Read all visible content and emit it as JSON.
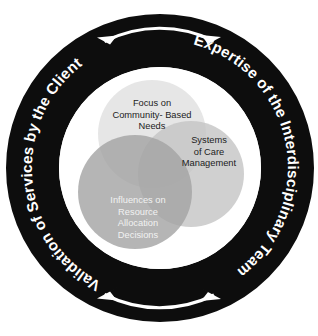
{
  "diagram": {
    "outer_ring": {
      "fill_color": "#0d0d0d",
      "text_color": "#ffffff",
      "labels": [
        {
          "id": "top-right",
          "text": "Expertise of the Interdisciplinary Team"
        },
        {
          "id": "bottom-left",
          "text": "Validation of Services by the Client"
        }
      ],
      "arrows": [
        {
          "id": "top-arc-arrow",
          "name": "double-headed-arc-arrow-top",
          "direction": "bidirectional",
          "position": "top"
        },
        {
          "id": "bottom-arc-arrow",
          "name": "double-headed-arc-arrow-bottom",
          "direction": "bidirectional",
          "position": "bottom"
        }
      ]
    },
    "venn": {
      "background_color": "#ffffff",
      "overlap_center_color": "#757575",
      "circles": [
        {
          "id": "focus-community",
          "label": "Focus on Community- Based Needs",
          "lines": [
            "Focus on",
            "Community- Based",
            "Needs"
          ],
          "fill_color": "#e4e4e4",
          "text_color": "#1c1c1c"
        },
        {
          "id": "systems-care",
          "label": "Systems of Care Management",
          "lines": [
            "Systems",
            "of Care",
            "Management"
          ],
          "fill_color": "#c4c4c4",
          "text_color": "#1c1c1c"
        },
        {
          "id": "influences-resource",
          "label": "Influences on Resource Allocation Decisions",
          "lines": [
            "Influences on",
            "Resource",
            "Allocation",
            "Decisions"
          ],
          "fill_color": "#a2a2a2",
          "text_color": "#f2f2f2"
        }
      ]
    }
  }
}
